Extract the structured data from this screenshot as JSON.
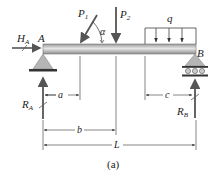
{
  "figure": {
    "caption": "(a)",
    "beam": {
      "left_support": "A",
      "right_support": "B",
      "color": "#c9c9c9"
    },
    "loads": {
      "P1": {
        "label": "P",
        "sub": "1",
        "angle_label": "α"
      },
      "P2": {
        "label": "P",
        "sub": "2"
      },
      "q": {
        "label": "q"
      }
    },
    "reactions": {
      "HA": {
        "label": "H",
        "sub": "A"
      },
      "RA": {
        "label": "R",
        "sub": "A"
      },
      "RB": {
        "label": "R",
        "sub": "B"
      }
    },
    "dimensions": {
      "a": "a",
      "b": "b",
      "c": "c",
      "L": "L"
    },
    "colors": {
      "force": "#555555",
      "support": "#b5b5b5",
      "dim": "#333333"
    }
  }
}
